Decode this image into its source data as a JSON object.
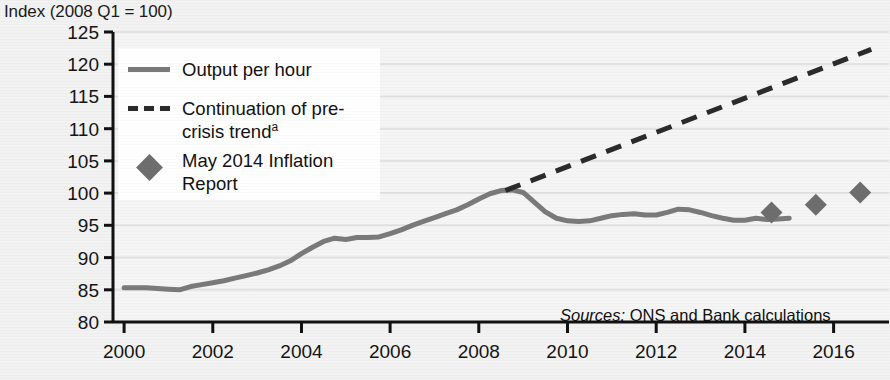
{
  "figure": {
    "axis_title": "Index (2008 Q1 = 100)",
    "sources_label": "Sources:",
    "sources_text": " ONS and Bank calculations",
    "colors": {
      "background": "#f2f2f2",
      "panel": "#f5f5f5",
      "output_line": "#7a7a7a",
      "trend_line": "#2b2b2b",
      "marker": "#6e6e6e",
      "axis": "#111111",
      "gridline": "#e2e2e2",
      "text": "#141414"
    }
  },
  "legend": {
    "items": [
      {
        "key": "solid-line-key",
        "label": "Output per hour",
        "sup": ""
      },
      {
        "key": "dashed-line-key",
        "label": "Continuation of pre-crisis trend",
        "sup": "a"
      },
      {
        "key": "diamond-marker-key",
        "label": "May 2014 Inflation Report",
        "sup": ""
      }
    ]
  },
  "chart_data": {
    "type": "line",
    "title": "",
    "subtitle": "",
    "xlabel": "",
    "ylabel": "Index (2008 Q1 = 100)",
    "xlim": [
      1999.75,
      2017.25
    ],
    "ylim": [
      80,
      125
    ],
    "yticks": [
      80,
      85,
      90,
      95,
      100,
      105,
      110,
      115,
      120,
      125
    ],
    "ytick_labels": [
      "80",
      "85",
      "90",
      "95",
      "100",
      "105",
      "110",
      "115",
      "120",
      "125"
    ],
    "xticks": [
      2000,
      2002,
      2004,
      2006,
      2008,
      2010,
      2012,
      2014,
      2016
    ],
    "xtick_labels": [
      "2000",
      "2002",
      "2004",
      "2006",
      "2008",
      "2010",
      "2012",
      "2014",
      "2016"
    ],
    "grid": true,
    "grid_axis": "y",
    "legend_position": "upper-left",
    "series": [
      {
        "name": "Output per hour",
        "type": "line",
        "style": "solid",
        "color": "#7a7a7a",
        "points": [
          [
            2000.0,
            85.3
          ],
          [
            2000.25,
            85.3
          ],
          [
            2000.5,
            85.3
          ],
          [
            2000.75,
            85.2
          ],
          [
            2001.0,
            85.1
          ],
          [
            2001.25,
            85.0
          ],
          [
            2001.5,
            85.5
          ],
          [
            2001.75,
            85.8
          ],
          [
            2002.0,
            86.1
          ],
          [
            2002.25,
            86.4
          ],
          [
            2002.5,
            86.8
          ],
          [
            2002.75,
            87.2
          ],
          [
            2003.0,
            87.6
          ],
          [
            2003.25,
            88.1
          ],
          [
            2003.5,
            88.7
          ],
          [
            2003.75,
            89.5
          ],
          [
            2004.0,
            90.6
          ],
          [
            2004.25,
            91.6
          ],
          [
            2004.5,
            92.5
          ],
          [
            2004.75,
            93.0
          ],
          [
            2005.0,
            92.8
          ],
          [
            2005.25,
            93.1
          ],
          [
            2005.5,
            93.1
          ],
          [
            2005.75,
            93.2
          ],
          [
            2006.0,
            93.7
          ],
          [
            2006.25,
            94.3
          ],
          [
            2006.5,
            95.0
          ],
          [
            2006.75,
            95.6
          ],
          [
            2007.0,
            96.2
          ],
          [
            2007.25,
            96.8
          ],
          [
            2007.5,
            97.4
          ],
          [
            2007.75,
            98.2
          ],
          [
            2008.0,
            99.1
          ],
          [
            2008.25,
            99.9
          ],
          [
            2008.5,
            100.4
          ],
          [
            2008.75,
            100.5
          ],
          [
            2009.0,
            100.1
          ],
          [
            2009.25,
            98.6
          ],
          [
            2009.5,
            97.1
          ],
          [
            2009.75,
            96.1
          ],
          [
            2010.0,
            95.7
          ],
          [
            2010.25,
            95.6
          ],
          [
            2010.5,
            95.7
          ],
          [
            2010.75,
            96.1
          ],
          [
            2011.0,
            96.5
          ],
          [
            2011.25,
            96.7
          ],
          [
            2011.5,
            96.8
          ],
          [
            2011.75,
            96.6
          ],
          [
            2012.0,
            96.6
          ],
          [
            2012.25,
            97.0
          ],
          [
            2012.5,
            97.5
          ],
          [
            2012.75,
            97.4
          ],
          [
            2013.0,
            97.0
          ],
          [
            2013.25,
            96.5
          ],
          [
            2013.5,
            96.1
          ],
          [
            2013.75,
            95.8
          ],
          [
            2014.0,
            95.8
          ],
          [
            2014.25,
            96.1
          ],
          [
            2014.5,
            95.9
          ],
          [
            2014.75,
            96.0
          ],
          [
            2015.0,
            96.1
          ]
        ]
      },
      {
        "name": "Continuation of pre-crisis trend",
        "type": "line",
        "style": "dashed",
        "color": "#2b2b2b",
        "points": [
          [
            2008.6,
            100.4
          ],
          [
            2016.85,
            122.3
          ]
        ]
      },
      {
        "name": "May 2014 Inflation Report",
        "type": "scatter",
        "marker": "diamond",
        "color": "#6e6e6e",
        "points": [
          [
            2014.6,
            97.0
          ],
          [
            2015.6,
            98.2
          ],
          [
            2016.6,
            100.1
          ]
        ]
      }
    ]
  }
}
